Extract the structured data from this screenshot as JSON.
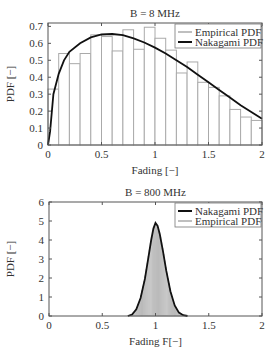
{
  "chart_data": [
    {
      "type": "bar",
      "title": "B = 8 MHz",
      "xlabel": "Fading [−]",
      "ylabel": "PDF [−]",
      "xlim": [
        0,
        2
      ],
      "ylim": [
        0,
        0.72
      ],
      "xticks": [
        "0",
        "0.5",
        "1",
        "1.5",
        "2"
      ],
      "yticks": [
        "0",
        "0.1",
        "0.2",
        "0.3",
        "0.4",
        "0.5",
        "0.6",
        "0.7"
      ],
      "grid": false,
      "legend_position": "upper right",
      "legend": [
        "Empirical PDF",
        "Nakagami PDF"
      ],
      "bin_width": 0.1,
      "bins": [
        0.0,
        0.1,
        0.2,
        0.3,
        0.4,
        0.5,
        0.6,
        0.7,
        0.8,
        0.9,
        1.0,
        1.1,
        1.2,
        1.3,
        1.4,
        1.5,
        1.6,
        1.7,
        1.8,
        1.9
      ],
      "series": [
        {
          "name": "Empirical PDF",
          "kind": "histogram",
          "values": [
            0.33,
            0.54,
            0.48,
            0.54,
            0.65,
            0.64,
            0.555,
            0.68,
            0.565,
            0.695,
            0.63,
            0.56,
            0.425,
            0.49,
            0.37,
            0.34,
            0.29,
            0.21,
            0.165,
            0.145
          ]
        },
        {
          "name": "Nakagami PDF",
          "kind": "line",
          "x": [
            0,
            0.02,
            0.05,
            0.1,
            0.15,
            0.2,
            0.3,
            0.4,
            0.5,
            0.6,
            0.7,
            0.8,
            0.9,
            1.0,
            1.1,
            1.2,
            1.3,
            1.4,
            1.5,
            1.6,
            1.7,
            1.8,
            1.9,
            2.0
          ],
          "y": [
            0,
            0.08,
            0.3,
            0.42,
            0.5,
            0.55,
            0.6,
            0.635,
            0.652,
            0.655,
            0.648,
            0.63,
            0.605,
            0.575,
            0.54,
            0.5,
            0.46,
            0.415,
            0.37,
            0.325,
            0.28,
            0.235,
            0.195,
            0.155
          ]
        }
      ]
    },
    {
      "type": "bar",
      "title": "B = 800 MHz",
      "xlabel": "Fading F[−]",
      "ylabel": "PDF [−]",
      "xlim": [
        0,
        2
      ],
      "ylim": [
        0,
        6
      ],
      "xticks": [
        "0",
        "0.5",
        "1",
        "1.5",
        "2"
      ],
      "yticks": [
        "0",
        "1",
        "2",
        "3",
        "4",
        "5",
        "6"
      ],
      "grid": false,
      "legend_position": "upper right",
      "legend": [
        "Nakagami PDF",
        "Empirical PDF"
      ],
      "series": [
        {
          "name": "Nakagami PDF",
          "kind": "line",
          "x": [
            0.74,
            0.78,
            0.82,
            0.86,
            0.9,
            0.93,
            0.96,
            0.98,
            1.0,
            1.02,
            1.04,
            1.07,
            1.1,
            1.14,
            1.18,
            1.22,
            1.26,
            1.3
          ],
          "y": [
            0.0,
            0.08,
            0.35,
            0.95,
            1.95,
            2.95,
            4.0,
            4.6,
            4.9,
            4.75,
            4.3,
            3.4,
            2.4,
            1.3,
            0.55,
            0.18,
            0.04,
            0.0
          ]
        },
        {
          "name": "Empirical PDF",
          "kind": "histogram",
          "bin_width": 0.01,
          "range": [
            0.76,
            1.26
          ],
          "note": "fine bins following Nakagami curve"
        }
      ]
    }
  ]
}
